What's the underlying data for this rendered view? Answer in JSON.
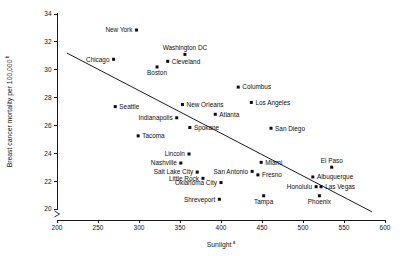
{
  "chart_data": {
    "type": "scatter",
    "title": "",
    "xlabel": "Sunlight",
    "xlabel_sup": "a",
    "ylabel": "Breast cancer mortality per 100,000",
    "ylabel_sup": "b",
    "xlim": [
      200,
      600
    ],
    "ylim": [
      19.6,
      34
    ],
    "xticks": [
      200,
      250,
      300,
      350,
      400,
      450,
      500,
      550,
      600
    ],
    "xtick_labels": [
      "200",
      "250",
      "300",
      "350",
      "400",
      "450",
      "500",
      "550",
      "600"
    ],
    "yticks": [
      20,
      22,
      24,
      26,
      28,
      30,
      32,
      34
    ],
    "ytick_labels": [
      "20",
      "22",
      "24",
      "26",
      "28",
      "30",
      "32",
      "34"
    ],
    "grid": false,
    "legend": "none",
    "axis_break": true,
    "marker_shape": "square",
    "marker_color": "#0d0d0d",
    "trend_line": {
      "type": "linear-fit",
      "x_start": 212,
      "y_start": 31.2,
      "x_end": 584,
      "y_end": 19.8,
      "color": "#1a1a1a"
    },
    "points": [
      {
        "label": "New York",
        "x": 297,
        "y": 32.85,
        "label_side": "left"
      },
      {
        "label": "Chicago",
        "x": 269,
        "y": 30.75,
        "label_side": "left"
      },
      {
        "label": "Washington DC",
        "x": 356,
        "y": 31.1,
        "label_side": "above"
      },
      {
        "label": "Cleveland",
        "x": 335,
        "y": 30.6,
        "label_side": "right"
      },
      {
        "label": "Boston",
        "x": 322,
        "y": 30.2,
        "label_side": "below"
      },
      {
        "label": "Columbus",
        "x": 421,
        "y": 28.75,
        "label_side": "right"
      },
      {
        "label": "Los Angeles",
        "x": 437,
        "y": 27.65,
        "label_side": "right"
      },
      {
        "label": "New Orleans",
        "x": 353,
        "y": 27.5,
        "label_side": "right"
      },
      {
        "label": "Seattle",
        "x": 271,
        "y": 27.35,
        "label_side": "right"
      },
      {
        "label": "Atlanta",
        "x": 393,
        "y": 26.8,
        "label_side": "right"
      },
      {
        "label": "Indianapolis",
        "x": 346,
        "y": 26.55,
        "label_side": "left"
      },
      {
        "label": "San Diego",
        "x": 461,
        "y": 25.8,
        "label_side": "right"
      },
      {
        "label": "Spokane",
        "x": 362,
        "y": 25.85,
        "label_side": "right"
      },
      {
        "label": "Tacoma",
        "x": 299,
        "y": 25.25,
        "label_side": "right"
      },
      {
        "label": "Lincoln",
        "x": 361,
        "y": 23.95,
        "label_side": "left"
      },
      {
        "label": "Miami",
        "x": 449,
        "y": 23.35,
        "label_side": "right"
      },
      {
        "label": "El Paso",
        "x": 535,
        "y": 23.0,
        "label_side": "above"
      },
      {
        "label": "Nashville",
        "x": 351,
        "y": 23.3,
        "label_side": "left"
      },
      {
        "label": "San Antonio",
        "x": 438,
        "y": 22.7,
        "label_side": "left"
      },
      {
        "label": "Salt Lake City",
        "x": 371,
        "y": 22.65,
        "label_side": "left"
      },
      {
        "label": "Fresno",
        "x": 445,
        "y": 22.45,
        "label_side": "right"
      },
      {
        "label": "Albuquerque",
        "x": 512,
        "y": 22.3,
        "label_side": "right"
      },
      {
        "label": "Little Rock",
        "x": 378,
        "y": 22.2,
        "label_side": "left"
      },
      {
        "label": "Honolulu",
        "x": 516,
        "y": 21.6,
        "label_side": "left"
      },
      {
        "label": "Las Vegas",
        "x": 522,
        "y": 21.6,
        "label_side": "right"
      },
      {
        "label": "Oklahoma City",
        "x": 400,
        "y": 21.9,
        "label_side": "left"
      },
      {
        "label": "Tampa",
        "x": 452,
        "y": 20.95,
        "label_side": "below"
      },
      {
        "label": "Phoenix",
        "x": 520,
        "y": 20.95,
        "label_side": "below"
      },
      {
        "label": "Shreveport",
        "x": 398,
        "y": 20.7,
        "label_side": "left"
      }
    ]
  }
}
